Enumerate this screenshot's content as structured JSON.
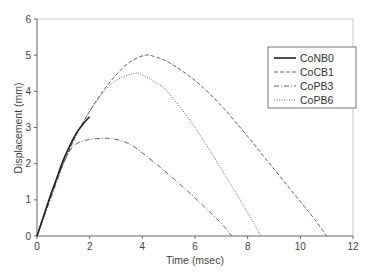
{
  "chart_data": {
    "type": "line",
    "title": "",
    "xlabel": "Time (msec)",
    "ylabel": "Displacement (mm)",
    "xlim": [
      0,
      12
    ],
    "ylim": [
      0,
      6
    ],
    "xticks": [
      0,
      2,
      4,
      6,
      8,
      10,
      12
    ],
    "yticks": [
      0,
      1,
      2,
      3,
      4,
      5,
      6
    ],
    "grid": false,
    "legend_position": "upper right",
    "series": [
      {
        "name": "CoNB0",
        "style": "solid",
        "points": [
          [
            0,
            0
          ],
          [
            0.25,
            0.55
          ],
          [
            0.5,
            1.1
          ],
          [
            0.75,
            1.6
          ],
          [
            1.0,
            2.1
          ],
          [
            1.25,
            2.5
          ],
          [
            1.5,
            2.85
          ],
          [
            1.75,
            3.1
          ],
          [
            2.0,
            3.3
          ]
        ]
      },
      {
        "name": "CoCB1",
        "style": "dashed",
        "points": [
          [
            0,
            0
          ],
          [
            0.5,
            1.05
          ],
          [
            1.0,
            2.0
          ],
          [
            1.5,
            2.8
          ],
          [
            2.0,
            3.45
          ],
          [
            2.5,
            4.0
          ],
          [
            3.0,
            4.45
          ],
          [
            3.5,
            4.8
          ],
          [
            4.1,
            5.0
          ],
          [
            4.5,
            4.95
          ],
          [
            5.0,
            4.8
          ],
          [
            6.0,
            4.3
          ],
          [
            7.0,
            3.6
          ],
          [
            8.0,
            2.75
          ],
          [
            9.0,
            1.85
          ],
          [
            10.0,
            0.95
          ],
          [
            10.5,
            0.5
          ],
          [
            11.0,
            0
          ]
        ]
      },
      {
        "name": "CoPB3",
        "style": "dashdot",
        "points": [
          [
            0,
            0
          ],
          [
            0.25,
            0.5
          ],
          [
            0.5,
            1.0
          ],
          [
            0.75,
            1.5
          ],
          [
            1.0,
            2.0
          ],
          [
            1.25,
            2.35
          ],
          [
            1.5,
            2.55
          ],
          [
            2.0,
            2.67
          ],
          [
            2.6,
            2.7
          ],
          [
            3.0,
            2.67
          ],
          [
            3.5,
            2.55
          ],
          [
            4.0,
            2.3
          ],
          [
            5.0,
            1.7
          ],
          [
            6.0,
            1.05
          ],
          [
            7.0,
            0.35
          ],
          [
            7.4,
            0
          ]
        ]
      },
      {
        "name": "CoPB6",
        "style": "dotted",
        "points": [
          [
            0,
            0
          ],
          [
            0.5,
            1.05
          ],
          [
            1.0,
            2.0
          ],
          [
            1.5,
            2.8
          ],
          [
            2.0,
            3.45
          ],
          [
            2.5,
            3.95
          ],
          [
            3.0,
            4.3
          ],
          [
            3.7,
            4.5
          ],
          [
            4.0,
            4.45
          ],
          [
            4.5,
            4.25
          ],
          [
            5.0,
            3.95
          ],
          [
            6.0,
            3.0
          ],
          [
            7.0,
            1.85
          ],
          [
            8.0,
            0.65
          ],
          [
            8.5,
            0
          ]
        ]
      }
    ]
  },
  "axes": {
    "x_title": "Time (msec)",
    "y_title": "Displacement (mm)"
  },
  "legend": {
    "items": [
      "CoNB0",
      "CoCB1",
      "CoPB3",
      "CoPB6"
    ]
  }
}
